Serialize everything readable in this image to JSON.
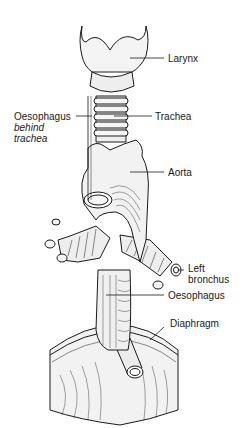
{
  "diagram": {
    "labels": {
      "larynx": "Larynx",
      "oesophagus_behind_1": "Oesophagus",
      "oesophagus_behind_2": "behind",
      "oesophagus_behind_3": "trachea",
      "trachea": "Trachea",
      "aorta": "Aorta",
      "left_bronchus_1": "Left",
      "left_bronchus_2": "bronchus",
      "oesophagus": "Oesophagus",
      "diaphragm": "Diaphragm"
    },
    "colors": {
      "line": "#1a1a1a",
      "background": "#ffffff",
      "fill": "#f4f4f4"
    }
  }
}
